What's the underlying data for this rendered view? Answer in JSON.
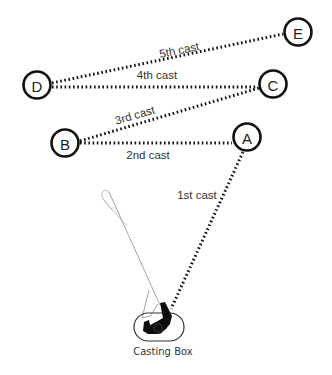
{
  "diagram": {
    "colors": {
      "line": "#111111",
      "text": "#333333",
      "background": "#ffffff"
    },
    "targets": [
      {
        "id": "A",
        "label": "A",
        "cx": 247,
        "cy": 137
      },
      {
        "id": "B",
        "label": "B",
        "cx": 65,
        "cy": 143
      },
      {
        "id": "C",
        "label": "C",
        "cx": 273,
        "cy": 84
      },
      {
        "id": "D",
        "label": "D",
        "cx": 37,
        "cy": 85
      },
      {
        "id": "E",
        "label": "E",
        "cx": 298,
        "cy": 32
      }
    ],
    "casts": [
      {
        "label": "1st cast",
        "from": "Casting Box",
        "to": "A"
      },
      {
        "label": "2nd cast",
        "from": "A",
        "to": "B"
      },
      {
        "label": "3rd cast",
        "from": "B",
        "to": "C"
      },
      {
        "label": "4th cast",
        "from": "C",
        "to": "D"
      },
      {
        "label": "5th cast",
        "from": "D",
        "to": "E"
      }
    ],
    "casting_box": {
      "label": "Casting Box"
    }
  }
}
